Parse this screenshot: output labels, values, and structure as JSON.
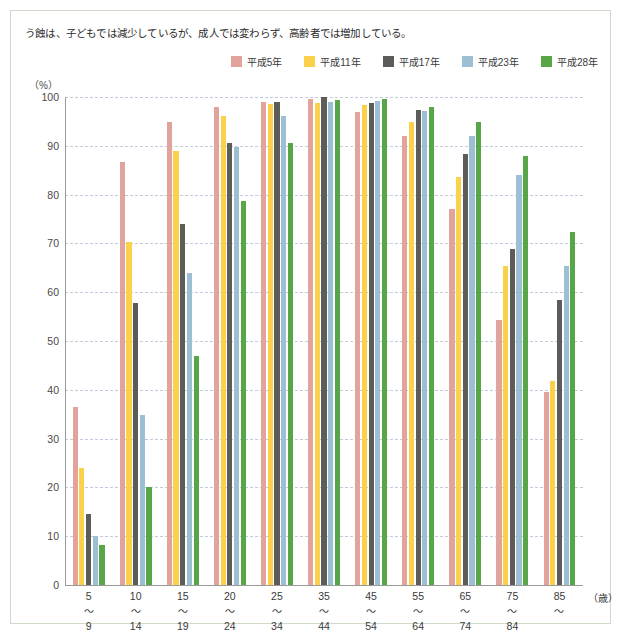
{
  "caption": "う蝕は、子どもでは減少しているが、成人では変わらず、高齢者では増加している。",
  "legend": {
    "items": [
      {
        "label": "平成5年",
        "color": "#e2a39c"
      },
      {
        "label": "平成11年",
        "color": "#fbd04b"
      },
      {
        "label": "平成17年",
        "color": "#5c5c58"
      },
      {
        "label": "平成23年",
        "color": "#9dbfd4"
      },
      {
        "label": "平成28年",
        "color": "#57a648"
      }
    ]
  },
  "axis": {
    "y_unit": "（%）",
    "x_unit": "（歳）",
    "y_ticks": [
      0,
      10,
      20,
      30,
      40,
      50,
      60,
      70,
      80,
      90,
      100
    ],
    "tilde": "〜"
  },
  "chart_data": {
    "type": "bar",
    "title": "う蝕は、子どもでは減少しているが、成人では変わらず、高齢者では増加している。",
    "xlabel": "（歳）",
    "ylabel": "（%）",
    "ylim": [
      0,
      100
    ],
    "grid": true,
    "legend_position": "top-right",
    "categories": [
      {
        "lo": "5",
        "hi": "9"
      },
      {
        "lo": "10",
        "hi": "14"
      },
      {
        "lo": "15",
        "hi": "19"
      },
      {
        "lo": "20",
        "hi": "24"
      },
      {
        "lo": "25",
        "hi": "34"
      },
      {
        "lo": "35",
        "hi": "44"
      },
      {
        "lo": "45",
        "hi": "54"
      },
      {
        "lo": "55",
        "hi": "64"
      },
      {
        "lo": "65",
        "hi": "74"
      },
      {
        "lo": "75",
        "hi": "84"
      },
      {
        "lo": "85",
        "hi": ""
      }
    ],
    "series": [
      {
        "name": "平成5年",
        "color": "#e2a39c",
        "values": [
          36.4,
          86.6,
          94.8,
          97.9,
          98.9,
          99.5,
          97.0,
          92.1,
          77.1,
          54.4,
          39.5
        ]
      },
      {
        "name": "平成11年",
        "color": "#fbd04b",
        "values": [
          24.0,
          70.2,
          89.0,
          96.1,
          98.6,
          98.7,
          98.4,
          94.8,
          83.7,
          65.3,
          41.8
        ]
      },
      {
        "name": "平成17年",
        "color": "#5c5c58",
        "values": [
          14.5,
          57.8,
          74.0,
          90.6,
          98.9,
          100.0,
          98.8,
          97.3,
          88.3,
          68.8,
          58.5
        ]
      },
      {
        "name": "平成23年",
        "color": "#9dbfd4",
        "values": [
          10.0,
          34.8,
          63.9,
          89.7,
          96.1,
          99.0,
          99.2,
          97.2,
          92.1,
          84.0,
          65.3
        ]
      },
      {
        "name": "平成28年",
        "color": "#57a648",
        "values": [
          8.2,
          20.0,
          46.9,
          78.6,
          90.5,
          99.4,
          99.5,
          97.9,
          94.9,
          87.9,
          72.4
        ]
      }
    ]
  }
}
